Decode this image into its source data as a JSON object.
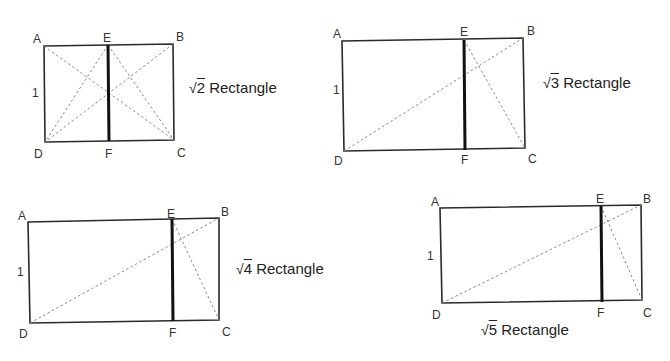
{
  "diagrams": [
    {
      "id": "sqrt2",
      "title_radical": "√",
      "title_radicand": "2",
      "title_suffix": " Rectangle",
      "side_label": "1",
      "points": {
        "A": "A",
        "B": "B",
        "C": "C",
        "D": "D",
        "E": "E",
        "F": "F"
      }
    },
    {
      "id": "sqrt3",
      "title_radical": "√",
      "title_radicand": "3",
      "title_suffix": " Rectangle",
      "side_label": "1",
      "points": {
        "A": "A",
        "B": "B",
        "C": "C",
        "D": "D",
        "E": "E",
        "F": "F"
      }
    },
    {
      "id": "sqrt4",
      "title_radical": "√",
      "title_radicand": "4",
      "title_suffix": " Rectangle",
      "side_label": "1",
      "points": {
        "A": "A",
        "B": "B",
        "C": "C",
        "D": "D",
        "E": "E",
        "F": "F"
      }
    },
    {
      "id": "sqrt5",
      "title_radical": "√",
      "title_radicand": "5",
      "title_suffix": " Rectangle",
      "side_label": "1",
      "points": {
        "A": "A",
        "B": "B",
        "C": "C",
        "D": "D",
        "E": "E",
        "F": "F"
      }
    }
  ],
  "colors": {
    "outline": "#2a2a2a",
    "divider": "#111111",
    "dashed": "#888888"
  }
}
